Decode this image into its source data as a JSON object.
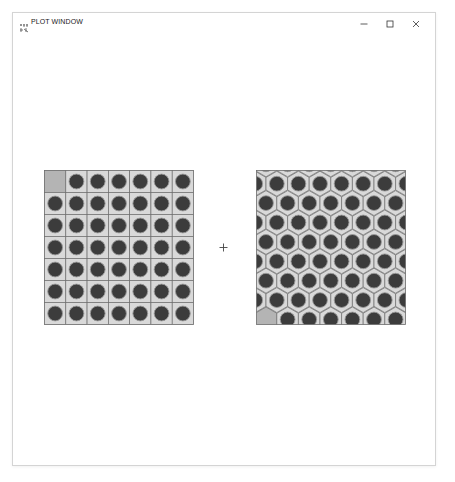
{
  "window": {
    "title": "PLOT WINDOW",
    "icon": "plot-app-icon",
    "controls": {
      "minimize": "minimize-icon",
      "maximize": "maximize-icon",
      "close": "close-icon"
    }
  },
  "plot": {
    "left_panel": {
      "kind": "square-lattice",
      "rows": 7,
      "cols": 7,
      "highlighted_cell": {
        "row": 0,
        "col": 0
      }
    },
    "center_marker": "+",
    "right_panel": {
      "kind": "hexagonal-lattice",
      "orientation": "pointy-top",
      "highlighted_cell": "bottom-left"
    }
  },
  "colors": {
    "cell_fill": "#d9d9d9",
    "cell_border": "#6e6e6e",
    "pin_fill": "#3c3c3c",
    "pin_ring": "#9a9a9a",
    "highlight_fill": "#b4b4b4",
    "window_border": "#d4d4d4"
  }
}
